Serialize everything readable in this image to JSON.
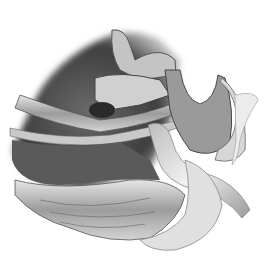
{
  "image": {
    "description": "Grayscale anatomical cross-section illustration",
    "width": 277,
    "height": 258,
    "colors": {
      "background": "#ffffff",
      "dark_cavity": "#4a4a4a",
      "mid_tissue": "#8a8a8a",
      "light_tissue": "#c8c8c8",
      "highlight": "#efefef",
      "tube": "#d9d9d9"
    }
  }
}
